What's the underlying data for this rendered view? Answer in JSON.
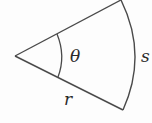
{
  "diagram": {
    "type": "circular-sector",
    "labels": {
      "angle": "θ",
      "arc": "s",
      "radius": "r"
    },
    "colors": {
      "stroke": "#4a4a4a",
      "text": "#2a2a2a",
      "background": "#fdfdfd"
    }
  }
}
